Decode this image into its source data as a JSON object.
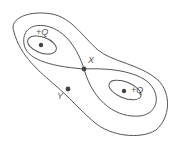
{
  "diagram": {
    "type": "equipotential-lines",
    "colors": {
      "line": "#555555",
      "point": "#444444",
      "text": "#555555",
      "background": "#ffffff"
    },
    "charges": [
      {
        "label": "+Q",
        "x": 41,
        "y": 45
      },
      {
        "label": "+Q",
        "x": 124,
        "y": 91
      }
    ],
    "points": [
      {
        "label": "X",
        "x": 84,
        "y": 69
      },
      {
        "label": "Y",
        "x": 68,
        "y": 89
      }
    ]
  }
}
